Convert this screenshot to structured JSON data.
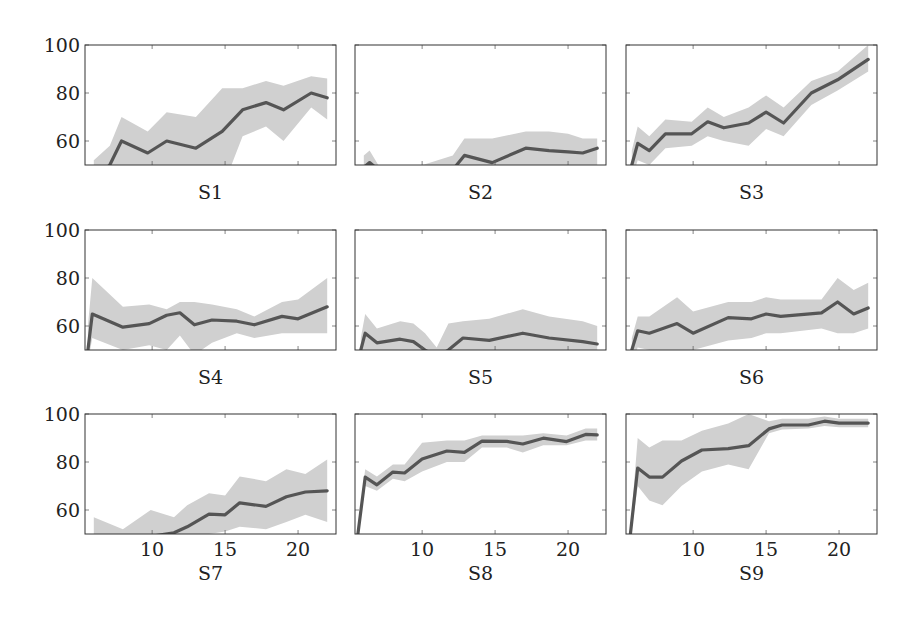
{
  "figure": {
    "panel_labels": [
      "S1",
      "S2",
      "S3",
      "S4",
      "S5",
      "S6",
      "S7",
      "S8",
      "S9"
    ],
    "y_tick_labels": [
      "100",
      "80",
      "60"
    ],
    "x_tick_labels": [
      "10",
      "15",
      "20"
    ],
    "colors": {
      "line": "#555555",
      "band": "#d0d0d0",
      "frame": "#333333"
    }
  },
  "chart_data": [
    {
      "type": "line",
      "title": "S1",
      "xlabel": "",
      "ylabel": "",
      "xlim": [
        5.4,
        22.6
      ],
      "ylim": [
        50,
        100
      ],
      "yticks": [
        60,
        80,
        100
      ],
      "xticks": [
        10,
        15,
        20
      ],
      "grid": false,
      "series": [
        {
          "name": "mean",
          "x": [
            6.0,
            7.1,
            7.9,
            9.7,
            11.0,
            13.0,
            14.8,
            16.2,
            17.8,
            19.0,
            20.9,
            22.0
          ],
          "y": [
            44,
            50,
            60,
            55,
            60,
            57,
            64,
            73,
            76,
            73,
            80,
            78
          ],
          "lower": [
            40,
            42,
            50,
            45,
            48,
            40,
            40,
            62,
            66,
            60,
            74,
            69
          ],
          "upper": [
            52,
            58,
            70,
            64,
            72,
            70,
            82,
            82,
            85,
            83,
            87,
            86
          ]
        }
      ]
    },
    {
      "type": "line",
      "title": "S2",
      "xlabel": "",
      "ylabel": "",
      "xlim": [
        5.4,
        22.6
      ],
      "ylim": [
        50,
        100
      ],
      "yticks": [
        60,
        80,
        100
      ],
      "xticks": [
        10,
        15,
        20
      ],
      "grid": false,
      "series": [
        {
          "name": "mean",
          "x": [
            6.0,
            6.4,
            7.0,
            9.0,
            12.1,
            12.9,
            14.8,
            17.1,
            18.7,
            20.0,
            21.0,
            22.0
          ],
          "y": [
            49,
            51,
            48,
            45,
            48,
            54,
            51,
            57,
            56,
            55.5,
            55,
            57
          ],
          "lower": [
            44,
            46,
            42,
            38,
            40,
            47,
            45,
            50,
            50,
            50,
            49,
            50
          ],
          "upper": [
            54,
            56,
            50,
            48,
            54,
            61,
            61,
            64,
            64,
            63,
            61,
            61
          ]
        }
      ]
    },
    {
      "type": "line",
      "title": "S3",
      "xlabel": "",
      "ylabel": "",
      "xlim": [
        5.4,
        22.6
      ],
      "ylim": [
        50,
        100
      ],
      "yticks": [
        60,
        80,
        100
      ],
      "xticks": [
        10,
        15,
        20
      ],
      "grid": false,
      "series": [
        {
          "name": "mean",
          "x": [
            5.8,
            6.2,
            7.0,
            8.1,
            9.9,
            11.0,
            12.1,
            13.8,
            15.0,
            16.2,
            18.1,
            19.9,
            22.0
          ],
          "y": [
            50,
            59,
            56,
            63,
            63,
            68,
            65.5,
            67.5,
            72,
            67.5,
            80,
            85.5,
            94
          ],
          "lower": [
            44,
            52,
            50,
            57,
            58,
            62,
            60,
            58,
            65,
            62,
            75,
            81,
            89
          ],
          "upper": [
            56,
            66,
            62,
            69,
            68,
            74,
            70,
            74,
            79,
            74,
            85,
            89,
            100
          ]
        }
      ]
    },
    {
      "type": "line",
      "title": "S4",
      "xlabel": "",
      "ylabel": "",
      "xlim": [
        5.4,
        22.6
      ],
      "ylim": [
        50,
        100
      ],
      "yticks": [
        60,
        80,
        100
      ],
      "xticks": [
        10,
        15,
        20
      ],
      "grid": false,
      "series": [
        {
          "name": "mean",
          "x": [
            5.6,
            5.9,
            8.0,
            9.8,
            11.0,
            11.9,
            12.9,
            14.1,
            15.8,
            17.0,
            18.9,
            20.0,
            22.0
          ],
          "y": [
            50,
            65,
            59.5,
            61,
            64.5,
            65.5,
            60.5,
            62.5,
            62,
            60.5,
            64,
            63,
            68
          ],
          "lower": [
            45,
            55,
            50,
            52,
            50,
            56,
            48,
            53,
            57,
            55,
            57,
            57,
            57
          ],
          "upper": [
            60,
            80,
            68,
            69,
            67,
            70,
            70,
            69,
            67,
            64,
            70,
            71,
            80
          ]
        }
      ]
    },
    {
      "type": "line",
      "title": "S5",
      "xlabel": "",
      "ylabel": "",
      "xlim": [
        5.4,
        22.6
      ],
      "ylim": [
        50,
        100
      ],
      "yticks": [
        60,
        80,
        100
      ],
      "xticks": [
        10,
        15,
        20
      ],
      "grid": false,
      "series": [
        {
          "name": "mean",
          "x": [
            5.8,
            6.1,
            6.9,
            8.5,
            9.4,
            10.2,
            11.0,
            11.8,
            12.8,
            14.6,
            16.9,
            18.7,
            21.0,
            22.0
          ],
          "y": [
            50,
            57,
            53,
            54.5,
            53.5,
            50,
            47,
            50,
            55,
            54,
            57,
            55,
            53.5,
            52.5
          ],
          "lower": [
            45,
            50,
            47,
            48,
            47,
            44,
            42,
            44,
            48,
            48,
            49,
            48,
            47,
            47
          ],
          "upper": [
            55,
            65,
            59,
            62,
            61,
            57,
            51,
            61,
            62,
            63,
            67,
            64,
            62,
            60
          ]
        }
      ]
    },
    {
      "type": "line",
      "title": "S6",
      "xlabel": "",
      "ylabel": "",
      "xlim": [
        5.4,
        22.6
      ],
      "ylim": [
        50,
        100
      ],
      "yticks": [
        60,
        80,
        100
      ],
      "xticks": [
        10,
        15,
        20
      ],
      "grid": false,
      "series": [
        {
          "name": "mean",
          "x": [
            5.8,
            6.2,
            7.0,
            8.9,
            10.0,
            12.4,
            14.0,
            15.0,
            16.0,
            18.8,
            19.9,
            21.0,
            22.0
          ],
          "y": [
            50,
            58,
            57,
            61,
            57,
            63.5,
            63,
            65,
            64,
            65.5,
            70,
            65,
            67.5
          ],
          "lower": [
            45,
            51,
            50,
            50,
            50,
            54,
            55,
            57,
            57,
            59,
            57,
            57,
            59
          ],
          "upper": [
            55,
            64,
            64,
            72,
            66,
            70,
            70,
            72,
            71,
            71,
            80,
            75,
            78
          ]
        }
      ]
    },
    {
      "type": "line",
      "title": "S7",
      "xlabel": "",
      "ylabel": "",
      "xlim": [
        5.4,
        22.6
      ],
      "ylim": [
        50,
        100
      ],
      "yticks": [
        60,
        80,
        100
      ],
      "xticks": [
        10,
        15,
        20
      ],
      "grid": false,
      "series": [
        {
          "name": "mean",
          "x": [
            6.0,
            8.0,
            9.9,
            11.5,
            12.4,
            13.9,
            15.0,
            16.0,
            17.8,
            19.2,
            20.5,
            22.0
          ],
          "y": [
            44,
            46,
            49,
            50.5,
            53,
            58.3,
            58,
            63,
            61.5,
            65.5,
            67.5,
            68
          ],
          "lower": [
            40,
            40,
            42,
            43,
            46,
            50,
            51,
            53,
            52,
            55,
            58,
            55
          ],
          "upper": [
            57,
            52,
            60,
            57,
            62,
            67,
            66,
            74,
            72,
            77,
            75,
            81
          ]
        }
      ]
    },
    {
      "type": "line",
      "title": "S8",
      "xlabel": "",
      "ylabel": "",
      "xlim": [
        5.4,
        22.6
      ],
      "ylim": [
        50,
        100
      ],
      "yticks": [
        60,
        80,
        100
      ],
      "xticks": [
        10,
        15,
        20
      ],
      "grid": false,
      "series": [
        {
          "name": "mean",
          "x": [
            5.6,
            6.1,
            6.9,
            8.0,
            8.8,
            10.0,
            11.7,
            12.9,
            14.1,
            15.8,
            16.9,
            18.3,
            19.9,
            21.2,
            22.0
          ],
          "y": [
            50,
            73.7,
            70.5,
            75.8,
            75.4,
            81.3,
            84.6,
            84,
            88.7,
            88.6,
            87.5,
            89.9,
            88.5,
            91.5,
            91.3
          ],
          "lower": [
            48,
            70,
            68,
            73,
            72,
            76,
            80,
            80,
            86,
            86,
            84,
            87,
            87,
            89,
            89
          ],
          "upper": [
            52,
            77,
            74,
            79,
            79,
            88,
            89,
            89,
            91,
            91,
            91,
            92,
            91,
            94,
            94
          ]
        }
      ]
    },
    {
      "type": "line",
      "title": "S9",
      "xlabel": "",
      "ylabel": "",
      "xlim": [
        5.4,
        22.6
      ],
      "ylim": [
        50,
        100
      ],
      "yticks": [
        60,
        80,
        100
      ],
      "xticks": [
        10,
        15,
        20
      ],
      "grid": false,
      "series": [
        {
          "name": "mean",
          "x": [
            5.7,
            6.2,
            7.0,
            7.9,
            9.2,
            10.6,
            12.4,
            13.8,
            15.2,
            16.1,
            17.9,
            19.0,
            20.0,
            22.0
          ],
          "y": [
            50,
            77.5,
            73.7,
            73.7,
            80.4,
            85,
            85.6,
            86.8,
            93.8,
            95.4,
            95.4,
            97,
            96.2,
            96.2
          ],
          "lower": [
            48,
            70,
            64,
            62,
            70,
            76,
            79,
            77,
            92,
            93.5,
            94,
            95,
            94.5,
            94.5
          ],
          "upper": [
            52,
            90,
            86,
            89,
            89,
            93,
            96,
            100,
            97,
            98,
            98,
            99,
            98,
            98
          ]
        }
      ]
    }
  ]
}
